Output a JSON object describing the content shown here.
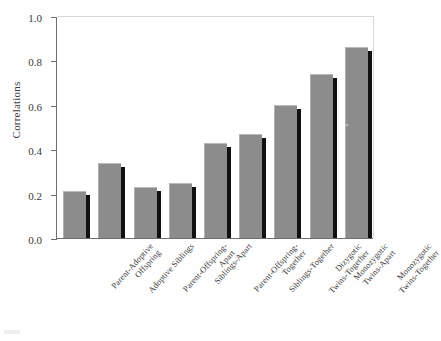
{
  "chart_data": {
    "type": "bar",
    "title": "",
    "xlabel": "",
    "ylabel": "Correlations",
    "ylim": [
      0.0,
      1.0
    ],
    "grid": false,
    "legend": null,
    "ytick_labels": [
      "1.0",
      "0.8",
      "0.6",
      "0.4",
      "0.2",
      "0.0"
    ],
    "ytick_values": [
      1.0,
      0.8,
      0.6,
      0.4,
      0.2,
      0.0
    ],
    "categories": [
      "Parent-Adoptive\nOffspring",
      "Adoptive Siblings",
      "Parent-Offspring-\nApart",
      "Siblings-Apart",
      "Parent-Offspring-\nTogether",
      "Siblings-Together",
      "Dizygotic\nTwins-Together",
      "Monozygotic\nTwins-Apart",
      "Monozygotic\nTwins-Together"
    ],
    "values": [
      0.21,
      0.34,
      0.23,
      0.25,
      0.43,
      0.47,
      0.6,
      0.74,
      0.86
    ],
    "bar_color": "#8c8c8c",
    "bar_shadow_color": "#111111",
    "axis_color": "#6e6e6e",
    "background_color": "#ffffff"
  }
}
